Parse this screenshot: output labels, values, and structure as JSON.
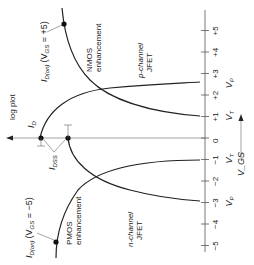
{
  "diagram": {
    "orientation": "rotated-90-ccw",
    "vgs_axis": {
      "label": "V_GS",
      "ticks": [
        {
          "value": 5,
          "label": "+5"
        },
        {
          "value": 4,
          "label": "+4"
        },
        {
          "value": 3,
          "label": "+3"
        },
        {
          "value": 2,
          "label": "+2"
        },
        {
          "value": 1,
          "label": "+1"
        },
        {
          "value": 0,
          "label": "0"
        },
        {
          "value": -1,
          "label": "−1"
        },
        {
          "value": -2,
          "label": "−2"
        },
        {
          "value": -3,
          "label": "−3"
        },
        {
          "value": -4,
          "label": "−4"
        },
        {
          "value": -5,
          "label": "−5"
        }
      ],
      "markers": [
        {
          "value": 2.5,
          "label": "V",
          "sub": "P"
        },
        {
          "value": 1,
          "label": "V",
          "sub": "T"
        },
        {
          "value": -1,
          "label": "V",
          "sub": "T"
        },
        {
          "value": -3,
          "label": "V",
          "sub": "P"
        }
      ]
    },
    "id_axis": {
      "label": "I",
      "sub": "D",
      "note": "log plot"
    },
    "curves": [
      {
        "name": "NMOS enhancement",
        "line1": "NMOS",
        "line2": "enhancement"
      },
      {
        "name": "PMOS enhancement",
        "line1": "PMOS",
        "line2": "enhancement"
      },
      {
        "name": "p-channel JFET",
        "line1": "p-channel",
        "line2": "JFET"
      },
      {
        "name": "n-channel JFET",
        "line1": "n-channel",
        "line2": "JFET"
      }
    ],
    "annotations": {
      "id_on_nmos": {
        "main": "I",
        "sub": "D(on)",
        "cond": "(V",
        "cond_sub": "GS",
        "cond_val": " = +5)"
      },
      "id_on_pmos": {
        "main": "I",
        "sub": "D(on)",
        "cond": "(V",
        "cond_sub": "GS",
        "cond_val": " = −5)"
      },
      "idss": {
        "main": "I",
        "sub": "DSS"
      }
    }
  }
}
